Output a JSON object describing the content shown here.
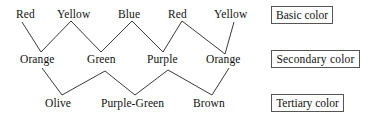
{
  "diagram": {
    "line_color": "#3a3a3a",
    "text_color": "#111111",
    "rows": [
      {
        "row_name": "basic",
        "legend": "Basic color",
        "nodes": [
          {
            "label": "Red",
            "x": 16,
            "y": 8
          },
          {
            "label": "Yellow",
            "x": 57,
            "y": 8
          },
          {
            "label": "Blue",
            "x": 118,
            "y": 8
          },
          {
            "label": "Red",
            "x": 168,
            "y": 8
          },
          {
            "label": "Yellow",
            "x": 214,
            "y": 8
          }
        ]
      },
      {
        "row_name": "secondary",
        "legend": "Secondary  color",
        "nodes": [
          {
            "label": "Orange",
            "x": 20,
            "y": 53
          },
          {
            "label": "Green",
            "x": 87,
            "y": 53
          },
          {
            "label": "Purple",
            "x": 147,
            "y": 53
          },
          {
            "label": "Orange",
            "x": 206,
            "y": 53
          }
        ]
      },
      {
        "row_name": "tertiary",
        "legend": "Tertiary color",
        "nodes": [
          {
            "label": "Olive",
            "x": 45,
            "y": 97
          },
          {
            "label": "Purple-Green",
            "x": 101,
            "y": 97
          },
          {
            "label": "Brown",
            "x": 193,
            "y": 97
          }
        ]
      }
    ],
    "legend_boxes": [
      {
        "name": "basic-color-legend",
        "label": "Basic color",
        "x": 271,
        "y": 6,
        "w": 62,
        "h": 18
      },
      {
        "name": "secondary-color-legend",
        "label": "Secondary  color",
        "x": 271,
        "y": 50,
        "w": 89,
        "h": 18
      },
      {
        "name": "tertiary-color-legend",
        "label": "Tertiary color",
        "x": 271,
        "y": 94,
        "w": 73,
        "h": 18
      }
    ],
    "upper_zigzag_points": "22,22 41,52 71,21 101,52 132,21 163,52 182,21 225,54 234,22",
    "lower_zigzag_points": "42,68 62,95 105,71 135,95 168,70 212,95 229,68"
  }
}
